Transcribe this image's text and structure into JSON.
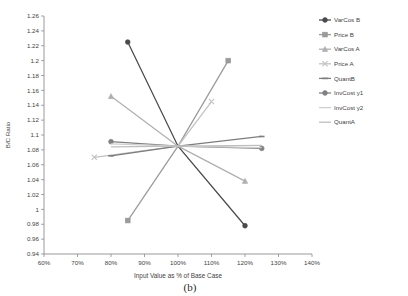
{
  "chart_data": {
    "type": "line",
    "title": "",
    "subtitle": "",
    "caption": "(b)",
    "xlabel": "Input Value as % of Base Case",
    "ylabel": "B/C Ratio",
    "xlim": [
      60,
      140
    ],
    "ylim": [
      0.94,
      1.26
    ],
    "xticks": [
      60,
      70,
      80,
      90,
      100,
      110,
      120,
      130,
      140
    ],
    "xticklabels": [
      "60%",
      "70%",
      "80%",
      "90%",
      "100%",
      "110%",
      "120%",
      "130%",
      "140%"
    ],
    "yticks": [
      0.94,
      0.96,
      0.98,
      1.0,
      1.02,
      1.04,
      1.06,
      1.08,
      1.1,
      1.12,
      1.14,
      1.16,
      1.18,
      1.2,
      1.22,
      1.24,
      1.26
    ],
    "yticklabels": [
      "0.94",
      "0.96",
      "0.98",
      "1",
      "1.02",
      "1.04",
      "1.06",
      "1.08",
      "1.1",
      "1.12",
      "1.14",
      "1.16",
      "1.18",
      "1.2",
      "1.22",
      "1.24",
      "1.26"
    ],
    "grid": false,
    "legend_position": "right",
    "base_point": {
      "x": 100,
      "y": 1.085
    },
    "series": [
      {
        "name": "VarCos B",
        "color": "#4a4a4a",
        "marker": "circle",
        "x": [
          85,
          100,
          120
        ],
        "y": [
          1.225,
          1.085,
          0.978
        ]
      },
      {
        "name": "Price B",
        "color": "#9a9a9a",
        "marker": "square",
        "x": [
          85,
          100,
          115
        ],
        "y": [
          0.985,
          1.085,
          1.2
        ]
      },
      {
        "name": "VarCos A",
        "color": "#b0b0b0",
        "marker": "triangle",
        "x": [
          80,
          100,
          120
        ],
        "y": [
          1.152,
          1.085,
          1.038
        ]
      },
      {
        "name": "Price A",
        "color": "#c2c2c2",
        "marker": "cross",
        "x": [
          75,
          100,
          110
        ],
        "y": [
          1.07,
          1.085,
          1.145
        ]
      },
      {
        "name": "QuantB",
        "color": "#7d7d7d",
        "marker": "dash",
        "x": [
          80,
          100,
          125
        ],
        "y": [
          1.072,
          1.085,
          1.098
        ]
      },
      {
        "name": "InvCost y1",
        "color": "#808080",
        "marker": "circle",
        "x": [
          80,
          100,
          125
        ],
        "y": [
          1.091,
          1.085,
          1.082
        ]
      },
      {
        "name": "InvCost y2",
        "color": "#cfcfcf",
        "marker": "line",
        "x": [
          80,
          100,
          125
        ],
        "y": [
          1.088,
          1.085,
          1.083
        ]
      },
      {
        "name": "QuantA",
        "color": "#bfbfbf",
        "marker": "line",
        "x": [
          80,
          100,
          125
        ],
        "y": [
          1.084,
          1.085,
          1.086
        ]
      }
    ]
  },
  "legend": {
    "items": [
      {
        "label": "VarCos B"
      },
      {
        "label": "Price B"
      },
      {
        "label": "VarCos A"
      },
      {
        "label": "Price A"
      },
      {
        "label": "QuantB"
      },
      {
        "label": "InvCost y1"
      },
      {
        "label": "InvCost y2"
      },
      {
        "label": "QuantA"
      }
    ]
  }
}
